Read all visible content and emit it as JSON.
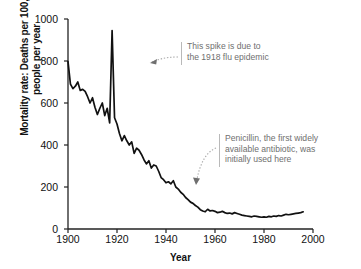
{
  "chart_data": {
    "type": "line",
    "title": "",
    "xlabel": "Year",
    "ylabel": "Mortality rate: Deaths per 100,000 people per year",
    "xlim": [
      1900,
      2000
    ],
    "ylim": [
      0,
      1000
    ],
    "xticks": [
      1900,
      1920,
      1940,
      1960,
      1980,
      2000
    ],
    "yticks": [
      0,
      200,
      400,
      600,
      800,
      1000
    ],
    "grid": false,
    "legend": null,
    "line_color": "#111111",
    "series": [
      {
        "name": "Infectious disease mortality rate",
        "x": [
          1900,
          1901,
          1902,
          1903,
          1904,
          1905,
          1906,
          1907,
          1908,
          1909,
          1910,
          1911,
          1912,
          1913,
          1914,
          1915,
          1916,
          1917,
          1918,
          1919,
          1920,
          1921,
          1922,
          1923,
          1924,
          1925,
          1926,
          1927,
          1928,
          1929,
          1930,
          1931,
          1932,
          1933,
          1934,
          1935,
          1936,
          1937,
          1938,
          1939,
          1940,
          1941,
          1942,
          1943,
          1944,
          1945,
          1946,
          1947,
          1948,
          1949,
          1950,
          1951,
          1952,
          1953,
          1954,
          1955,
          1956,
          1957,
          1958,
          1959,
          1960,
          1961,
          1962,
          1963,
          1964,
          1965,
          1966,
          1967,
          1968,
          1969,
          1970,
          1971,
          1972,
          1973,
          1974,
          1975,
          1976,
          1977,
          1978,
          1979,
          1980,
          1981,
          1982,
          1983,
          1984,
          1985,
          1986,
          1987,
          1988,
          1989,
          1990,
          1991,
          1992,
          1993,
          1994,
          1995,
          1996
        ],
        "y": [
          797,
          690,
          668,
          680,
          700,
          660,
          665,
          655,
          630,
          600,
          625,
          580,
          545,
          575,
          600,
          540,
          575,
          505,
          945,
          530,
          500,
          455,
          420,
          445,
          420,
          400,
          415,
          360,
          385,
          375,
          355,
          330,
          310,
          325,
          290,
          305,
          300,
          275,
          245,
          235,
          220,
          225,
          215,
          230,
          200,
          190,
          175,
          165,
          150,
          140,
          128,
          122,
          112,
          104,
          92,
          86,
          82,
          94,
          86,
          88,
          84,
          78,
          80,
          84,
          78,
          74,
          76,
          72,
          78,
          74,
          70,
          66,
          64,
          62,
          60,
          58,
          62,
          60,
          58,
          56,
          58,
          56,
          60,
          58,
          62,
          60,
          64,
          62,
          66,
          70,
          68,
          70,
          72,
          74,
          76,
          78,
          82
        ]
      }
    ],
    "annotations": [
      {
        "id": "flu-spike",
        "text": "This spike is due to\nthe 1918 flu epidemic",
        "points_to_year": 1918,
        "points_to_value": 945
      },
      {
        "id": "penicillin",
        "text": "Penicillin, the first widely\navailable antibiotic, was\ninitially used here",
        "points_to_year": 1945,
        "points_to_value": 190
      }
    ]
  },
  "axis": {
    "y_tick_labels": [
      "1000",
      "800",
      "600",
      "400",
      "200",
      "0"
    ],
    "x_tick_labels": [
      "1900",
      "1920",
      "1940",
      "1960",
      "1980",
      "2000"
    ],
    "y_title": "Mortality rate: Deaths per 100,000 people per year",
    "x_title": "Year"
  },
  "annotations": {
    "flu": "This spike is due to\nthe 1918 flu epidemic",
    "penicillin": "Penicillin, the first widely\navailable antibiotic, was\ninitially used here"
  },
  "colors": {
    "background": "#ffffff",
    "line": "#111111",
    "axis": "#222222",
    "annotation_text": "#6f6f6f",
    "annotation_rule": "#b9b9b9"
  }
}
